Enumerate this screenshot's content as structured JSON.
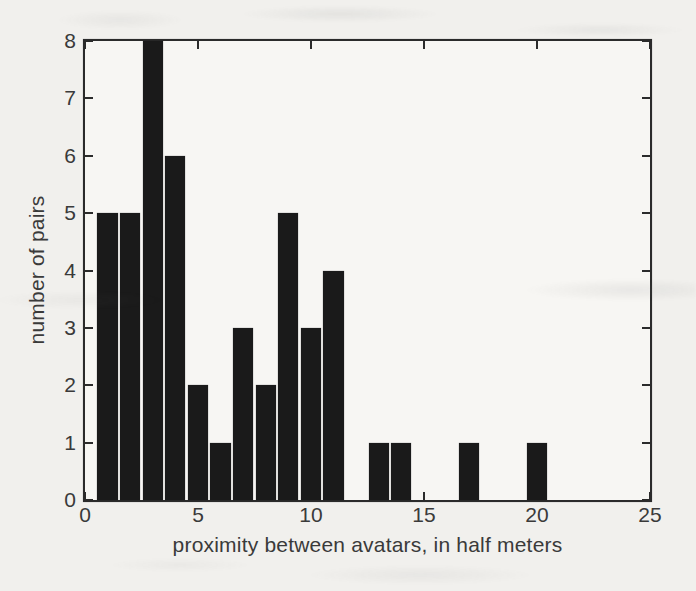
{
  "figure": {
    "background_color": "#f1f0ed",
    "plot_background_color": "#f7f6f3",
    "bar_color": "#1a1a1a",
    "axis_color": "#2b2b2b",
    "text_color": "#3a3a3a"
  },
  "chart_data": {
    "type": "bar",
    "title": "",
    "xlabel": "proximity between avatars, in half meters",
    "ylabel": "number of pairs",
    "x": [
      1,
      2,
      3,
      4,
      5,
      6,
      7,
      8,
      9,
      10,
      11,
      13,
      14,
      17,
      20
    ],
    "values": [
      5,
      5,
      8,
      6,
      2,
      1,
      3,
      2,
      5,
      3,
      4,
      1,
      1,
      1,
      1
    ],
    "bar_width": 0.9,
    "xlim": [
      0,
      25
    ],
    "ylim": [
      0,
      8
    ],
    "xticks": [
      0,
      5,
      10,
      15,
      20,
      25
    ],
    "yticks": [
      0,
      1,
      2,
      3,
      4,
      5,
      6,
      7,
      8
    ],
    "grid": false,
    "legend": "none",
    "tick_direction": "in",
    "box": true
  }
}
